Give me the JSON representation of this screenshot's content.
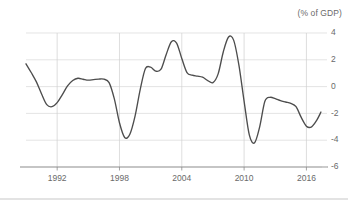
{
  "chart_data": {
    "type": "line",
    "title": "(% of GDP)",
    "xlabel": "",
    "ylabel": "",
    "ylim": [
      -6,
      4
    ],
    "xlim": [
      1989,
      2017.5
    ],
    "grid": true,
    "legend": false,
    "legend_position": "none",
    "yticks": [
      4,
      2,
      0,
      -2,
      -4,
      -6
    ],
    "ytick_labels": [
      "4",
      "2",
      "0",
      "-2",
      "-4",
      "-6"
    ],
    "xticks": [
      1992,
      1998,
      2004,
      2010,
      2016
    ],
    "xtick_labels": [
      "1992",
      "1998",
      "2004",
      "2010",
      "2016"
    ],
    "series": [
      {
        "name": "Balance",
        "color": "#4d4d4d",
        "x": [
          1989.0,
          1989.5,
          1990.0,
          1990.5,
          1991.0,
          1991.5,
          1992.0,
          1992.5,
          1993.0,
          1993.5,
          1994.0,
          1994.5,
          1995.0,
          1995.5,
          1996.0,
          1996.5,
          1997.0,
          1997.5,
          1998.0,
          1998.5,
          1999.0,
          1999.5,
          2000.0,
          2000.5,
          2001.0,
          2001.5,
          2002.0,
          2002.5,
          2003.0,
          2003.5,
          2004.0,
          2004.5,
          2005.0,
          2005.5,
          2006.0,
          2006.5,
          2007.0,
          2007.5,
          2008.0,
          2008.5,
          2009.0,
          2009.5,
          2010.0,
          2010.5,
          2011.0,
          2011.5,
          2012.0,
          2012.5,
          2013.0,
          2013.5,
          2014.0,
          2014.5,
          2015.0,
          2015.5,
          2016.0,
          2016.5,
          2017.0,
          2017.4
        ],
        "values": [
          1.7,
          1.05,
          0.35,
          -0.55,
          -1.35,
          -1.5,
          -1.2,
          -0.6,
          0.05,
          0.45,
          0.62,
          0.55,
          0.48,
          0.52,
          0.56,
          0.55,
          0.3,
          -0.9,
          -2.7,
          -3.8,
          -3.55,
          -2.2,
          -0.2,
          1.35,
          1.45,
          1.15,
          1.3,
          2.4,
          3.35,
          3.25,
          2.1,
          1.05,
          0.85,
          0.78,
          0.7,
          0.45,
          0.3,
          0.95,
          2.6,
          3.7,
          3.45,
          1.6,
          -1.1,
          -3.6,
          -4.2,
          -3.0,
          -1.1,
          -0.8,
          -0.9,
          -1.05,
          -1.15,
          -1.25,
          -1.5,
          -2.3,
          -2.95,
          -3.0,
          -2.5,
          -1.9
        ]
      }
    ]
  }
}
